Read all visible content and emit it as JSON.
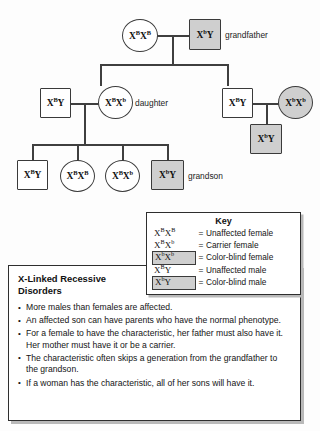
{
  "diagram": {
    "title_hidden": "X-linked recessive pedigree",
    "nodes": [
      {
        "id": "g1-mother",
        "shape": "circle",
        "affected": false,
        "allele1": "X",
        "sup1": "B",
        "allele2": "X",
        "sup2": "B",
        "label": ""
      },
      {
        "id": "g1-father",
        "shape": "square",
        "affected": true,
        "allele1": "X",
        "sup1": "b",
        "allele2": "Y",
        "sup2": "",
        "label": "grandfather"
      },
      {
        "id": "g2-son-in-law",
        "shape": "square",
        "affected": false,
        "allele1": "X",
        "sup1": "B",
        "allele2": "Y",
        "sup2": "",
        "label": ""
      },
      {
        "id": "g2-daughter",
        "shape": "circle",
        "affected": false,
        "allele1": "X",
        "sup1": "B",
        "allele2": "X",
        "sup2": "b",
        "label": "daughter"
      },
      {
        "id": "g2-son",
        "shape": "square",
        "affected": false,
        "allele1": "X",
        "sup1": "B",
        "allele2": "Y",
        "sup2": "",
        "label": ""
      },
      {
        "id": "g2-wife",
        "shape": "circle",
        "affected": true,
        "allele1": "X",
        "sup1": "b",
        "allele2": "X",
        "sup2": "b",
        "label": ""
      },
      {
        "id": "g3-cousin-son",
        "shape": "square",
        "affected": true,
        "allele1": "X",
        "sup1": "b",
        "allele2": "Y",
        "sup2": "",
        "label": ""
      },
      {
        "id": "g3-child-1",
        "shape": "square",
        "affected": false,
        "allele1": "X",
        "sup1": "B",
        "allele2": "Y",
        "sup2": "",
        "label": ""
      },
      {
        "id": "g3-child-2",
        "shape": "circle",
        "affected": false,
        "allele1": "X",
        "sup1": "B",
        "allele2": "X",
        "sup2": "B",
        "label": ""
      },
      {
        "id": "g3-child-3",
        "shape": "circle",
        "affected": false,
        "allele1": "X",
        "sup1": "B",
        "allele2": "X",
        "sup2": "b",
        "label": ""
      },
      {
        "id": "g3-grandson",
        "shape": "square",
        "affected": true,
        "allele1": "X",
        "sup1": "b",
        "allele2": "Y",
        "sup2": "",
        "label": "grandson"
      }
    ],
    "labels": {
      "grandfather": "grandfather",
      "daughter": "daughter",
      "grandson": "grandson"
    },
    "colors": {
      "affected_fill": "#cfcfcf",
      "unaffected_fill": "#ffffff",
      "stroke": "#3a3a3a",
      "line": "#3f3f3f"
    }
  },
  "key": {
    "title": "Key",
    "equals": "=",
    "rows": [
      {
        "allele1": "X",
        "sup1": "B",
        "allele2": "X",
        "sup2": "B",
        "boxed": false,
        "description": "Unaffected female"
      },
      {
        "allele1": "X",
        "sup1": "B",
        "allele2": "X",
        "sup2": "b",
        "boxed": false,
        "description": "Carrier female"
      },
      {
        "allele1": "X",
        "sup1": "b",
        "allele2": "X",
        "sup2": "b",
        "boxed": true,
        "description": "Color-blind female"
      },
      {
        "allele1": "X",
        "sup1": "B",
        "allele2": "Y",
        "sup2": "",
        "boxed": false,
        "description": "Unaffected male"
      },
      {
        "allele1": "X",
        "sup1": "b",
        "allele2": "Y",
        "sup2": "",
        "boxed": true,
        "description": "Color-blind male"
      }
    ]
  },
  "facts": {
    "title": "X-Linked Recessive Disorders",
    "items": [
      "More males than females are affected.",
      "An affected son can have parents who have the normal phenotype.",
      "For a female to have the characteristic, her father must also have it. Her mother must have it or be a carrier.",
      "The characteristic often skips a generation from the grandfather to the grandson.",
      "If a woman has the characteristic, all of her sons will have it."
    ]
  }
}
